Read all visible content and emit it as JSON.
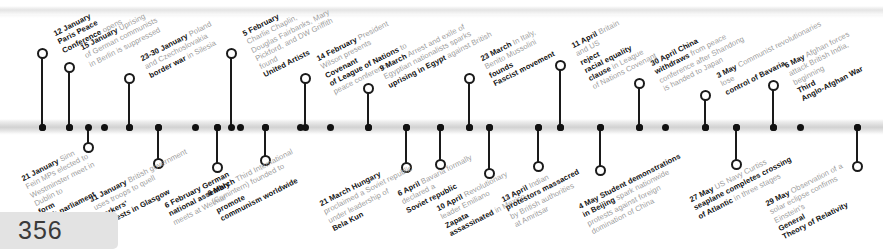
{
  "page": {
    "number": "356"
  },
  "timeline": {
    "year": "1919",
    "events": [
      {
        "id": "paris-peace-conference",
        "date": "12 January",
        "text": "Paris Peace Conference opens",
        "bold_tail": "",
        "side": "above",
        "x": 42,
        "label_x": 52,
        "label_y": 30,
        "stem_top": 57,
        "lines": [
          {
            "b": "12 January",
            "t": ""
          },
          {
            "b": "Paris Peace",
            "t": ""
          },
          {
            "b": "Conference",
            "t": " opens"
          }
        ]
      },
      {
        "id": "berlin-uprising",
        "date": "15 January",
        "text": "Uprising of German communists in Berlin is suppressed",
        "side": "above",
        "x": 69,
        "label_x": 79,
        "label_y": 44,
        "stem_top": 71,
        "lines": [
          {
            "b": "15 January",
            "t": " Uprising"
          },
          {
            "b": "",
            "t": "of German communists"
          },
          {
            "b": "",
            "t": "in Berlin is suppressed"
          }
        ]
      },
      {
        "id": "silesia-border-war",
        "date": "23-30 January",
        "text": "Poland and Czechoslovakia fight border war in Silesia",
        "side": "above",
        "x": 129,
        "label_x": 139,
        "label_y": 55,
        "stem_top": 82,
        "lines": [
          {
            "b": "23-30 January",
            "t": " Poland"
          },
          {
            "b": "",
            "t": "and Czechoslovakia "
          },
          {
            "b": "border war",
            "t": " in Silesia"
          }
        ]
      },
      {
        "id": "united-artists-founded",
        "date": "5 February",
        "text": "Charlie Chaplin, Douglas Fairbanks, Mary Pickford, and DW Griffith found United Artists",
        "side": "above",
        "x": 231,
        "label_x": 241,
        "label_y": 30,
        "stem_top": 57,
        "lines": [
          {
            "b": "5 February",
            "t": ""
          },
          {
            "b": "",
            "t": "Charlie Chaplin,"
          },
          {
            "b": "",
            "t": "Douglas Fairbanks, Mary"
          },
          {
            "b": "",
            "t": "Pickford, and DW Griffith"
          },
          {
            "b": "",
            "t": "found "
          },
          {
            "b": "United Artists",
            "t": ""
          }
        ]
      },
      {
        "id": "league-covenant-presented",
        "date": "14 February",
        "text": "President Wilson presents Covenant of League of Nations to peace conference",
        "side": "above",
        "x": 305,
        "label_x": 315,
        "label_y": 55,
        "stem_top": 82,
        "lines": [
          {
            "b": "14 February",
            "t": " President"
          },
          {
            "b": "",
            "t": "Wilson presents "
          },
          {
            "b": "Covenant",
            "t": ""
          },
          {
            "b": "of League of Nations",
            "t": " to"
          },
          {
            "b": "",
            "t": "peace conference"
          }
        ]
      },
      {
        "id": "egypt-uprising",
        "date": "9 March",
        "text": "Arrest and exile of Egyptian nationalists sparks uprising in Egypt against British",
        "side": "above",
        "x": 368,
        "label_x": 378,
        "label_y": 65,
        "stem_top": 92,
        "lines": [
          {
            "b": "9 March",
            "t": " Arrest and exile of"
          },
          {
            "b": "",
            "t": "Egyptian nationalists sparks"
          },
          {
            "b": "uprising in Egypt",
            "t": " against British"
          }
        ]
      },
      {
        "id": "mussolini-fascist-movement",
        "date": "23 March",
        "text": "In Italy, Benito Mussolini founds Fascist movement",
        "side": "above",
        "x": 469,
        "label_x": 479,
        "label_y": 55,
        "stem_top": 82,
        "lines": [
          {
            "b": "23 March",
            "t": " In Italy,"
          },
          {
            "b": "",
            "t": "Benito Mussolini "
          },
          {
            "b": "founds",
            "t": ""
          },
          {
            "b": "Fascist movement",
            "t": ""
          }
        ]
      },
      {
        "id": "racial-equality-clause-rejected",
        "date": "11 April",
        "text": "Britain and US reject racial equality clause in League of Nations Covenant",
        "side": "above",
        "x": 560,
        "label_x": 570,
        "label_y": 42,
        "stem_top": 69,
        "lines": [
          {
            "b": "11 April",
            "t": " Britain"
          },
          {
            "b": "",
            "t": "and US "
          },
          {
            "b": "reject",
            "t": ""
          },
          {
            "b": "racial equality",
            "t": ""
          },
          {
            "b": "clause",
            "t": " in League"
          },
          {
            "b": "",
            "t": "of Nations Covenant"
          }
        ]
      },
      {
        "id": "china-withdraws-peace-conference",
        "date": "30 April",
        "text": "China withdraws from peace conference after Shandong is handed to Japan",
        "side": "above",
        "x": 639,
        "label_x": 649,
        "label_y": 60,
        "stem_top": 87,
        "lines": [
          {
            "b": "30 April China",
            "t": ""
          },
          {
            "b": "withdraws",
            "t": " from peace"
          },
          {
            "b": "",
            "t": "conference after Shandong"
          },
          {
            "b": "",
            "t": "is handed to Japan"
          }
        ]
      },
      {
        "id": "bavaria-communists-lose-control",
        "date": "3 May",
        "text": "Communist revolutionaries lose control of Bavaria",
        "side": "above",
        "x": 705,
        "label_x": 715,
        "label_y": 72,
        "stem_top": 99,
        "lines": [
          {
            "b": "3 May",
            "t": " Communist revolutionaries"
          },
          {
            "b": "",
            "t": "lose "
          },
          {
            "b": "control of Bavaria",
            "t": ""
          }
        ]
      },
      {
        "id": "third-anglo-afghan-war",
        "date": "6 May",
        "text": "Afghan forces attack British India, beginning Third Anglo-Afghan War",
        "side": "above",
        "x": 773,
        "label_x": 783,
        "label_y": 62,
        "stem_top": 89,
        "lines": [
          {
            "b": "6 May",
            "t": " Afghan forces"
          },
          {
            "b": "",
            "t": "attack British India,"
          },
          {
            "b": "",
            "t": "beginning "
          },
          {
            "b": "Third",
            "t": ""
          },
          {
            "b": "Anglo-Afghan War",
            "t": ""
          }
        ]
      },
      {
        "id": "irish-parliament-formed",
        "date": "21 January",
        "text": "Sinn Fein MPs elected to Westminster meet in Dublin to form Irish parliament",
        "side": "below",
        "x": 88,
        "label_x": 20,
        "label_y": 175,
        "stem_bottom": 144,
        "lines": [
          {
            "b": "21 January",
            "t": " Sinn"
          },
          {
            "b": "",
            "t": "Fein MPs elected to"
          },
          {
            "b": "",
            "t": "Westminster meet in"
          },
          {
            "b": "",
            "t": "Dublin to "
          },
          {
            "b": "form",
            "t": ""
          },
          {
            "b": "Irish parliament",
            "t": ""
          }
        ]
      },
      {
        "id": "glasgow-workers-protests",
        "date": "31 January",
        "text": "British government uses troops to quell workers' protests in Glasgow",
        "side": "below",
        "x": 158,
        "label_x": 88,
        "label_y": 196,
        "stem_bottom": 160,
        "lines": [
          {
            "b": "31 January",
            "t": " British government"
          },
          {
            "b": "",
            "t": "uses troops to quell "
          },
          {
            "b": "workers'",
            "t": ""
          },
          {
            "b": "protests in Glasgow",
            "t": ""
          }
        ]
      },
      {
        "id": "weimar-national-assembly",
        "date": "6 February",
        "text": "German national assembly meets at Weimar",
        "side": "below",
        "x": 217,
        "label_x": 163,
        "label_y": 202,
        "stem_bottom": 164,
        "lines": [
          {
            "b": "6 February German",
            "t": ""
          },
          {
            "b": "national assembly",
            "t": ""
          },
          {
            "b": "",
            "t": "meets at Weimar"
          }
        ]
      },
      {
        "id": "comintern-founded",
        "date": "6 March",
        "text": "Third International (Comintern) founded to promote communism worldwide",
        "side": "below",
        "x": 265,
        "label_x": 206,
        "label_y": 190,
        "stem_bottom": 157,
        "lines": [
          {
            "b": "6 March",
            "t": " Third International"
          },
          {
            "b": "",
            "t": "(Comintern) founded to "
          },
          {
            "b": "promote",
            "t": ""
          },
          {
            "b": "communism worldwide",
            "t": ""
          }
        ]
      },
      {
        "id": "hungary-soviet-republic",
        "date": "21 March",
        "text": "Hungary proclaimed a Soviet republic under leadership of Bela Kun",
        "side": "below",
        "x": 406,
        "label_x": 318,
        "label_y": 200,
        "stem_bottom": 164,
        "lines": [
          {
            "b": "21 March Hungary",
            "t": ""
          },
          {
            "b": "",
            "t": "proclaimed a Soviet republic"
          },
          {
            "b": "",
            "t": "under leadership of "
          },
          {
            "b": "Bela Kun",
            "t": ""
          }
        ]
      },
      {
        "id": "bavaria-soviet-republic",
        "date": "6 April",
        "text": "Bavaria formally declared a Soviet republic",
        "side": "below",
        "x": 440,
        "label_x": 396,
        "label_y": 190,
        "stem_bottom": 161,
        "lines": [
          {
            "b": "6 April",
            "t": " Bavaria formally"
          },
          {
            "b": "",
            "t": "declared a "
          },
          {
            "b": "Soviet republic",
            "t": ""
          }
        ]
      },
      {
        "id": "zapata-assassinated",
        "date": "10 April",
        "text": "Revolutionary leader Emiliano Zapata assassinated in Mexico",
        "side": "below",
        "x": 489,
        "label_x": 435,
        "label_y": 205,
        "stem_bottom": 170,
        "lines": [
          {
            "b": "10 April",
            "t": " Revolutionary"
          },
          {
            "b": "",
            "t": "leader Emiliano "
          },
          {
            "b": "Zapata",
            "t": ""
          },
          {
            "b": "assassinated",
            "t": " in Mexico"
          }
        ]
      },
      {
        "id": "amritsar-massacre",
        "date": "13 April",
        "text": "Indian protestors massacred by British authorities at Amritsar",
        "side": "below",
        "x": 538,
        "label_x": 500,
        "label_y": 196,
        "stem_bottom": 163,
        "lines": [
          {
            "b": "13 April",
            "t": " Indian"
          },
          {
            "b": "protestors massacred",
            "t": ""
          },
          {
            "b": "",
            "t": "by British authorities"
          },
          {
            "b": "",
            "t": "at Amritsar"
          }
        ]
      },
      {
        "id": "may-fourth-movement",
        "date": "4 May",
        "text": "Student demonstrations in Beijing spark nationwide protests against foreign domination of China",
        "side": "below",
        "x": 600,
        "label_x": 577,
        "label_y": 203,
        "stem_bottom": 167,
        "lines": [
          {
            "b": "4 May Student demonstrations",
            "t": ""
          },
          {
            "b": "in Beijing",
            "t": " spark nationwide"
          },
          {
            "b": "",
            "t": "protests against foreign"
          },
          {
            "b": "",
            "t": "domination of China"
          }
        ]
      },
      {
        "id": "nc4-atlantic-crossing",
        "date": "27 May",
        "text": "US Navy Curtiss seaplane completes crossing of Atlantic in three stages",
        "side": "below",
        "x": 736,
        "label_x": 688,
        "label_y": 196,
        "stem_bottom": 161,
        "lines": [
          {
            "b": "27 May",
            "t": " US Navy Curtiss"
          },
          {
            "b": "seaplane completes crossing",
            "t": ""
          },
          {
            "b": "of Atlantic",
            "t": " in three stages"
          }
        ]
      },
      {
        "id": "eclipse-confirms-relativity",
        "date": "29 May",
        "text": "Observation of a solar eclipse confirms Einstein's General Theory of Relativity",
        "side": "below",
        "x": 857,
        "label_x": 764,
        "label_y": 200,
        "stem_bottom": 163,
        "lines": [
          {
            "b": "29 May",
            "t": " Observation of a"
          },
          {
            "b": "",
            "t": "solar eclipse confirms"
          },
          {
            "b": "",
            "t": "Einstein's "
          },
          {
            "b": "General",
            "t": ""
          },
          {
            "b": "Theory of Relativity",
            "t": ""
          }
        ]
      }
    ],
    "plain_ticks": [
      42,
      69,
      104,
      129,
      158,
      195,
      217,
      240,
      265,
      300,
      330,
      368,
      406,
      440,
      469,
      489,
      538,
      560,
      600,
      639,
      665,
      705,
      736,
      773,
      800,
      857
    ]
  },
  "colors": {
    "line": "#1a1a1a",
    "bold_text": "#111111",
    "light_text": "#9b9b9b",
    "bar": "#d2d2d2",
    "page_box": "#e3e3e3"
  }
}
